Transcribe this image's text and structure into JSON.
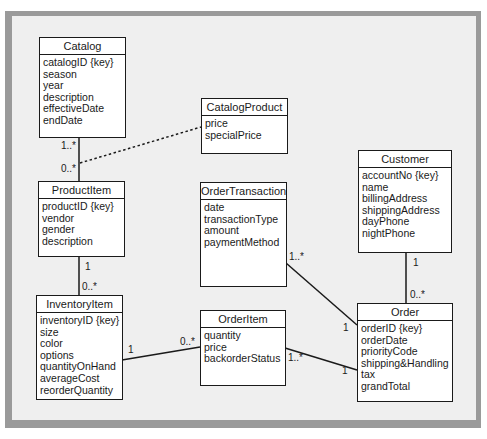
{
  "classes": {
    "catalog": {
      "name": "Catalog",
      "attributes": [
        "catalogID {key}",
        "season",
        "year",
        "description",
        "effectiveDate",
        "endDate"
      ]
    },
    "catalog_product": {
      "name": "CatalogProduct",
      "attributes": [
        "price",
        "specialPrice"
      ]
    },
    "product_item": {
      "name": "ProductItem",
      "attributes": [
        "productID {key}",
        "vendor",
        "gender",
        "description"
      ]
    },
    "order_transaction": {
      "name": "OrderTransaction",
      "attributes": [
        "date",
        "transactionType",
        "amount",
        "paymentMethod"
      ]
    },
    "customer": {
      "name": "Customer",
      "attributes": [
        "accountNo {key}",
        "name",
        "billingAddress",
        "shippingAddress",
        "dayPhone",
        "nightPhone"
      ]
    },
    "inventory_item": {
      "name": "InventoryItem",
      "attributes": [
        "inventoryID {key}",
        "size",
        "color",
        "options",
        "quantityOnHand",
        "averageCost",
        "reorderQuantity"
      ]
    },
    "order_item": {
      "name": "OrderItem",
      "attributes": [
        "quantity",
        "price",
        "backorderStatus"
      ]
    },
    "order": {
      "name": "Order",
      "attributes": [
        "orderID {key}",
        "orderDate",
        "priorityCode",
        "shipping&Handling",
        "tax",
        "grandTotal"
      ]
    }
  },
  "associations": {
    "catalog_productitem": {
      "from": "Catalog",
      "to": "ProductItem",
      "from_mult": "1..*",
      "to_mult": "0..*"
    },
    "catalogproduct_link": {
      "association_class": "CatalogProduct",
      "style": "dotted"
    },
    "productitem_inventoryitem": {
      "from": "ProductItem",
      "to": "InventoryItem",
      "from_mult": "1",
      "to_mult": "0..*"
    },
    "inventoryitem_orderitem": {
      "from": "InventoryItem",
      "to": "OrderItem",
      "from_mult": "1",
      "to_mult": "0..*"
    },
    "orderitem_order": {
      "from": "OrderItem",
      "to": "Order",
      "from_mult": "1..*",
      "to_mult": "1"
    },
    "ordertransaction_order": {
      "from": "OrderTransaction",
      "to": "Order",
      "from_mult": "1..*",
      "to_mult": "1"
    },
    "customer_order": {
      "from": "Customer",
      "to": "Order",
      "from_mult": "1",
      "to_mult": "0..*"
    }
  }
}
